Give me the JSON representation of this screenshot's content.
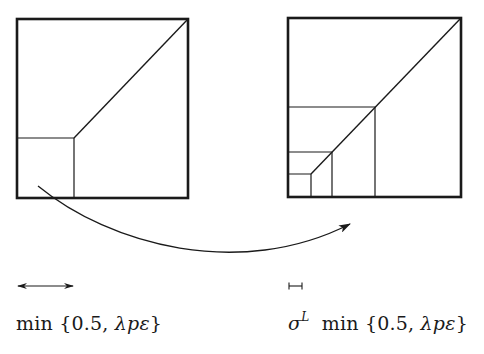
{
  "diagram": {
    "type": "two-panel scaling illustration",
    "left_panel": {
      "name": "original square",
      "outer_box": {
        "x": 17,
        "y": 19,
        "w": 171,
        "h": 179
      },
      "inner_squares": [
        {
          "x": 17,
          "y": 138,
          "w": 57,
          "h": 60
        }
      ],
      "diagonal": {
        "from": [
          74,
          138
        ],
        "to": [
          188,
          19
        ]
      }
    },
    "right_panel": {
      "name": "scaled square",
      "outer_box": {
        "x": 288,
        "y": 18,
        "w": 173,
        "h": 179
      },
      "inner_squares": [
        {
          "x": 288,
          "y": 107,
          "w": 87,
          "h": 90
        },
        {
          "x": 288,
          "y": 152,
          "w": 44,
          "h": 45
        },
        {
          "x": 288,
          "y": 174,
          "w": 23,
          "h": 23
        }
      ],
      "diagonal": {
        "from": [
          311,
          174
        ],
        "to": [
          461,
          18
        ]
      }
    },
    "arrow": {
      "from": [
        38,
        186
      ],
      "to": [
        350,
        224
      ],
      "label": "maps to"
    },
    "scale_markers": {
      "left": {
        "x1": 17,
        "x2": 73,
        "y": 286,
        "style": "double-arrow"
      },
      "right": {
        "x1": 289,
        "x2": 302,
        "y": 286,
        "style": "bar"
      }
    },
    "colors": {
      "stroke": "#1a1a1a",
      "background": "#ffffff"
    }
  },
  "labels": {
    "left": {
      "min": "min",
      "set_open": "{0.5, ",
      "lambda": "λ",
      "p": "p",
      "epsilon": "ε",
      "set_close": "}"
    },
    "right": {
      "sigma": "σ",
      "superscript": "L",
      "min": "min",
      "set_open": "{0.5, ",
      "lambda": "λ",
      "p": "p",
      "epsilon": "ε",
      "set_close": "}"
    }
  }
}
